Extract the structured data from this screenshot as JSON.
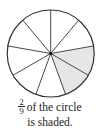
{
  "figure": {
    "type": "fraction-circle",
    "total_parts": 9,
    "shaded_parts": 2,
    "shaded_sector_indices": [
      2,
      3
    ],
    "start_angle_deg": -90,
    "center": [
      50.7,
      53.5
    ],
    "radius": 43.5,
    "colors": {
      "shade": "#e6e6e6",
      "stroke": "#333333",
      "background": "#ffffff"
    }
  },
  "caption": {
    "fraction_numerator": "2",
    "fraction_denominator": "9",
    "line1_text": "of the circle",
    "line2_text": "is shaded."
  }
}
